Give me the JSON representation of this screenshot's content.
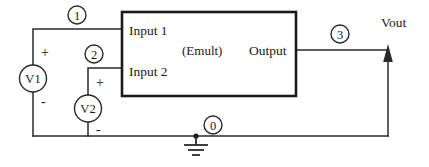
{
  "diagram": {
    "block": {
      "name": "Emult",
      "center_label": "(Emult)",
      "input1_label": "Input 1",
      "input2_label": "Input 2",
      "output_label": "Output"
    },
    "sources": [
      {
        "id": "v1",
        "label": "V1",
        "plus": "+",
        "minus": "-"
      },
      {
        "id": "v2",
        "label": "V2",
        "plus": "+",
        "minus": "-"
      }
    ],
    "nodes": [
      {
        "id": "n1",
        "label": "1"
      },
      {
        "id": "n2",
        "label": "2"
      },
      {
        "id": "n3",
        "label": "3"
      },
      {
        "id": "n0",
        "label": "0"
      }
    ],
    "output_terminal": {
      "label": "Vout"
    },
    "ground": {
      "name": "ground-symbol"
    },
    "colors": {
      "wire": "#2a2a2a",
      "block_outline": "#1a1a1a",
      "text": "#1a1a1a",
      "background": "#ffffff"
    }
  }
}
